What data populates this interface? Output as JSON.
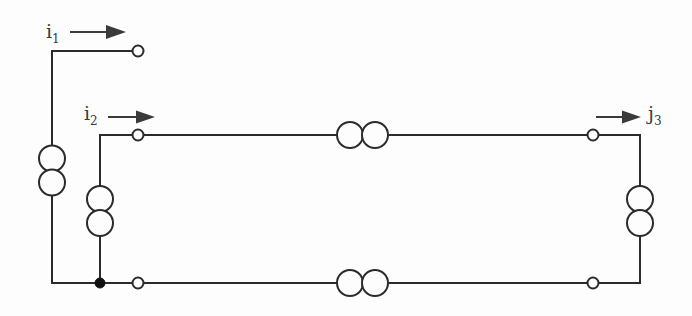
{
  "figure": {
    "kind": "electrical-circuit-schematic",
    "background_color": "#fdfdfd",
    "line_color": "#2b2b2b",
    "label_color": "#3a3a3a"
  },
  "labels": {
    "i1": {
      "symbol": "i",
      "subscript": "1",
      "text": "i1"
    },
    "i2": {
      "symbol": "i",
      "subscript": "2",
      "text": "i2"
    },
    "j3": {
      "symbol": "j",
      "subscript": "3",
      "text": "j3"
    }
  },
  "components": {
    "inductor_left_vertical": {
      "name": "L1",
      "coils": 2,
      "orientation": "vertical"
    },
    "inductor_mid_vertical": {
      "name": "L2",
      "coils": 2,
      "orientation": "vertical"
    },
    "inductor_right_vertical": {
      "name": "L3",
      "coils": 2,
      "orientation": "vertical"
    },
    "inductor_top_horizontal": {
      "name": "L4",
      "coils": 2,
      "orientation": "horizontal"
    },
    "inductor_bottom_horizontal": {
      "name": "L5",
      "coils": 2,
      "orientation": "horizontal"
    }
  },
  "terminals": {
    "port1_top": {
      "x": 138,
      "y": 51,
      "type": "open"
    },
    "port2_top": {
      "x": 138,
      "y": 135,
      "type": "open"
    },
    "port2_bottom": {
      "x": 138,
      "y": 283,
      "type": "open"
    },
    "port3_top": {
      "x": 593,
      "y": 135,
      "type": "open"
    },
    "port3_bottom": {
      "x": 593,
      "y": 283,
      "type": "open"
    }
  },
  "junctions": {
    "common_node": {
      "x": 100,
      "y": 283,
      "type": "filled"
    }
  },
  "arrows": {
    "i1_arrow": {
      "x1": 70,
      "y1": 32,
      "x2": 120,
      "y2": 32,
      "direction": "right"
    },
    "i2_arrow": {
      "x1": 108,
      "y1": 117,
      "x2": 152,
      "y2": 117,
      "direction": "right"
    },
    "j3_arrow": {
      "x1": 596,
      "y1": 117,
      "x2": 641,
      "y2": 117,
      "direction": "right"
    }
  }
}
